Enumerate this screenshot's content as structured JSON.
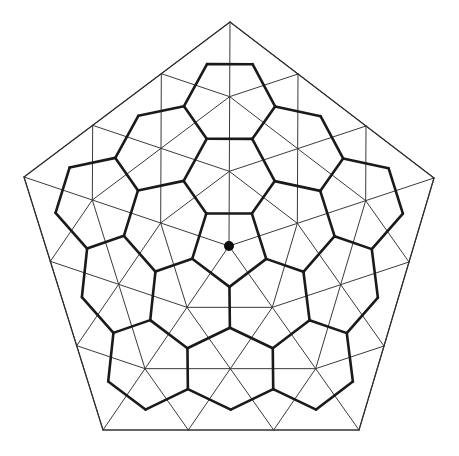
{
  "diagram": {
    "center": [
      229,
      246
    ],
    "pentagon_vertices": [
      [
        230,
        22
      ],
      [
        434,
        178
      ],
      [
        359,
        430
      ],
      [
        103,
        430
      ],
      [
        24,
        177
      ]
    ],
    "subdivision_frequency": 3,
    "colors": {
      "background": "#ffffff",
      "triangle_lines": "#3a3a3a",
      "outline": "#2e2e2e",
      "cells": "#1a1a1a",
      "center_dot": "#0d0d0d"
    },
    "center_dot_radius": 5
  }
}
